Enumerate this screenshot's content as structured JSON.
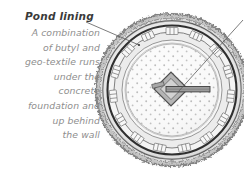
{
  "annotation": {
    "title": "Pond lining",
    "lines": [
      "A combination",
      "of butyl and",
      "geo-textile runs",
      "under the",
      "concrete",
      "foundation and",
      "up behind",
      "the wall"
    ]
  },
  "diagram": {
    "rings": [
      {
        "name": "outer-coping-stone",
        "radius": 76,
        "fill": "#b9b9b9",
        "stroke": "#6a6a6a"
      },
      {
        "name": "outer-wall-course",
        "radius": 69,
        "fill": "#cfcfcf",
        "stroke": "#555555"
      },
      {
        "name": "dark-lining-ring",
        "radius": 64,
        "fill": "#f2f2f2",
        "stroke": "#3c3c3c"
      },
      {
        "name": "block-paving-ring",
        "radius": 58,
        "fill": "#e8e8e8",
        "stroke": "#7d7d7d"
      },
      {
        "name": "inner-edging-ring",
        "radius": 50,
        "fill": "#f4f4f4",
        "stroke": "#8a8a8a"
      },
      {
        "name": "pond-floor",
        "radius": 46,
        "fill": "#fafafa",
        "stroke": "#9a9a9a"
      }
    ],
    "center": {
      "cx": 172,
      "cy": 90
    },
    "center_feature": {
      "name": "diamond-stepping-stone",
      "fill": "#b0b0b0",
      "stroke": "#555555"
    },
    "plank": {
      "name": "plank-bridge",
      "fill": "#9e9e9e",
      "stroke": "#4a4a4a"
    },
    "leaders": [
      {
        "name": "pond-lining-leader",
        "x1": 86,
        "y1": 22,
        "x2": 139,
        "y2": 45
      },
      {
        "name": "center-leader",
        "x1": 243,
        "y1": 22,
        "x2": 178,
        "y2": 92
      }
    ],
    "colors": {
      "text_title": "#3a3a3a",
      "text_body": "#8e8e8e",
      "ink": "#6a6a6a",
      "background": "#ffffff"
    }
  }
}
